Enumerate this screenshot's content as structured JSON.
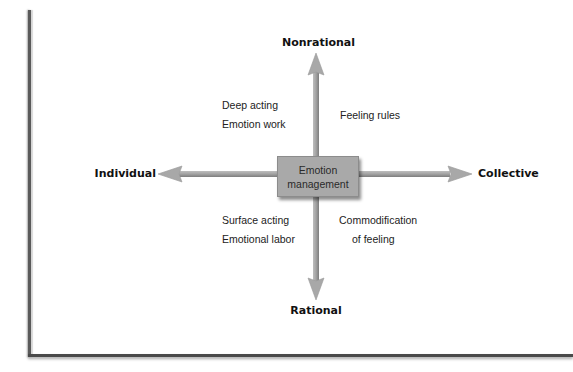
{
  "diagram": {
    "center": {
      "line1": "Emotion",
      "line2": "management"
    },
    "axes": {
      "top": "Nonrational",
      "bottom": "Rational",
      "left": "Individual",
      "right": "Collective"
    },
    "quadrants": {
      "top_left": [
        "Deep acting",
        "Emotion work"
      ],
      "top_right": [
        "Feeling rules"
      ],
      "bottom_left": [
        "Surface acting",
        "Emotional labor"
      ],
      "bottom_right": [
        "Commodification",
        "of feeling"
      ]
    },
    "colors": {
      "arrow": "#a6a6a6",
      "arrow_edge": "#8a8a8a",
      "box": "#a9a9a9",
      "frame": "#4a4a4a"
    }
  }
}
